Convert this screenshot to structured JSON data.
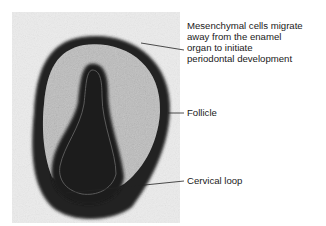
{
  "figure": {
    "type": "micrograph",
    "colors": {
      "background": "#ffffff",
      "tissue_dark": "#1c1c1c",
      "tissue_light": "#d8d8d8",
      "text": "#1a1a1a"
    }
  },
  "labels": [
    {
      "id": "mesenchymal",
      "text": "Mesenchymal cells migrate\naway from the enamel\norgan to initiate\nperiodontal development"
    },
    {
      "id": "follicle",
      "text": "Follicle"
    },
    {
      "id": "cervical_loop",
      "text": "Cervical loop"
    }
  ]
}
